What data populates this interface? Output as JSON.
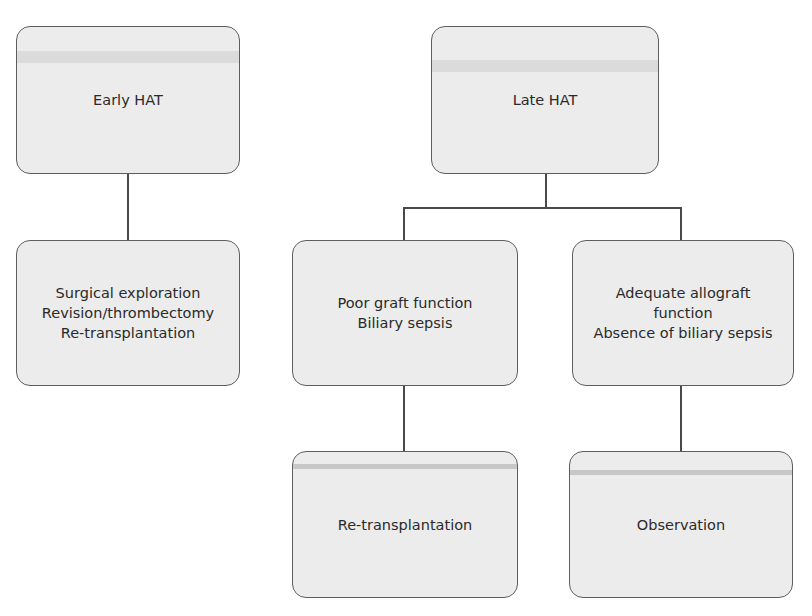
{
  "diagram": {
    "type": "flowchart",
    "nodes": {
      "early_hat": {
        "lines": [
          "Early HAT"
        ]
      },
      "early_action": {
        "lines": [
          "Surgical exploration",
          "Revision/thrombectomy",
          "Re-transplantation"
        ]
      },
      "late_hat": {
        "lines": [
          "Late HAT"
        ]
      },
      "late_poor": {
        "lines": [
          "Poor graft function",
          "Biliary sepsis"
        ]
      },
      "late_adequate": {
        "lines": [
          "Adequate allograft",
          "function",
          "Absence of biliary sepsis"
        ]
      },
      "late_poor_action": {
        "lines": [
          "Re-transplantation"
        ]
      },
      "late_adequate_action": {
        "lines": [
          "Observation"
        ]
      }
    },
    "edges": [
      [
        "early_hat",
        "early_action"
      ],
      [
        "late_hat",
        "late_poor"
      ],
      [
        "late_hat",
        "late_adequate"
      ],
      [
        "late_poor",
        "late_poor_action"
      ],
      [
        "late_adequate",
        "late_adequate_action"
      ]
    ],
    "colors": {
      "box_fill": "#ececec",
      "box_border": "#5e5e5e",
      "connector": "#4a4a4a",
      "text": "#2a2a2a"
    }
  }
}
